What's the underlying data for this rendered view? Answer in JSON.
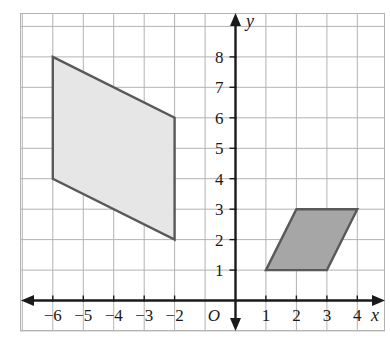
{
  "figure": {
    "axis_labels": {
      "x": "x",
      "y": "y",
      "origin": "O"
    },
    "colors": {
      "grid_line": "#b3b3b3",
      "axis_line": "#1a1a1a",
      "shape_stroke": "#595959",
      "large_shape_fill": "#e6e6e6",
      "small_shape_fill": "#a6a6a6",
      "background": "#ffffff",
      "label_text": "#1a1a1a"
    }
  },
  "chart_data": {
    "type": "scatter",
    "title": "",
    "xlabel": "x",
    "ylabel": "y",
    "grid": true,
    "legend": "none",
    "xlim": [
      -7,
      5
    ],
    "ylim": [
      -1,
      9
    ],
    "x_tick_labels": [
      "−6",
      "−5",
      "−4",
      "−3",
      "−2",
      "1",
      "2",
      "3",
      "4"
    ],
    "x_tick_values": [
      -6,
      -5,
      -4,
      -3,
      -2,
      1,
      2,
      3,
      4
    ],
    "y_tick_labels": [
      "1",
      "2",
      "3",
      "4",
      "5",
      "6",
      "7",
      "8"
    ],
    "y_tick_values": [
      1,
      2,
      3,
      4,
      5,
      6,
      7,
      8
    ],
    "origin_label": "O",
    "shapes": [
      {
        "name": "large-parallelogram",
        "kind": "parallelogram",
        "fill": "#e6e6e6",
        "stroke": "#595959",
        "vertices": [
          [
            -6,
            8
          ],
          [
            -2,
            6
          ],
          [
            -2,
            2
          ],
          [
            -6,
            4
          ]
        ]
      },
      {
        "name": "small-parallelogram",
        "kind": "parallelogram",
        "fill": "#a6a6a6",
        "stroke": "#595959",
        "vertices": [
          [
            1,
            1
          ],
          [
            3,
            1
          ],
          [
            4,
            3
          ],
          [
            2,
            3
          ]
        ]
      }
    ]
  }
}
